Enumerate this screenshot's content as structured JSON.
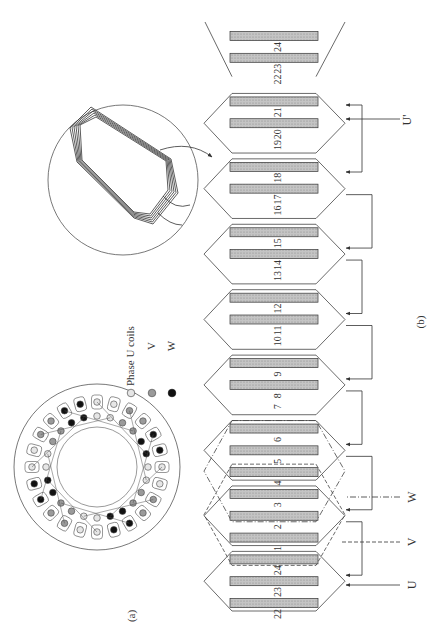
{
  "figure": {
    "panel_a_label": "(a)",
    "panel_b_label": "(b)"
  },
  "legend": {
    "items": [
      {
        "label": "Phase  U  coils",
        "phase": "U",
        "color": "#e6e6e6"
      },
      {
        "label": "V",
        "phase": "V",
        "color": "#9a9a9a"
      },
      {
        "label": "W",
        "phase": "W",
        "color": "#111111"
      }
    ]
  },
  "stator": {
    "slot_count": 24,
    "slot_phases": [
      "U",
      "U",
      "V",
      "V",
      "W",
      "W",
      "U",
      "U",
      "V",
      "V",
      "W",
      "W",
      "U",
      "U",
      "V",
      "V",
      "W",
      "W",
      "U",
      "U",
      "V",
      "V",
      "W",
      "W"
    ]
  },
  "inset": {
    "description": "single multi-turn diamond coil",
    "turns": 6
  },
  "winding": {
    "slot_labels_top_to_bottom": [
      "24",
      "23",
      "22",
      "21",
      "20",
      "19",
      "18",
      "17",
      "16",
      "15",
      "14",
      "13",
      "12",
      "11",
      "10",
      "9",
      "8",
      "7",
      "6",
      "5",
      "4",
      "3",
      "2",
      "1",
      "24",
      "23",
      "22"
    ],
    "terminals": [
      {
        "id": "U_prime",
        "label": "U'"
      },
      {
        "id": "W",
        "label": "W"
      },
      {
        "id": "V",
        "label": "V"
      },
      {
        "id": "U",
        "label": "U"
      }
    ]
  },
  "colors": {
    "line": "#444444",
    "slot_fill": "#bdbdbd",
    "slot_stroke": "#333333",
    "background": "#ffffff"
  }
}
